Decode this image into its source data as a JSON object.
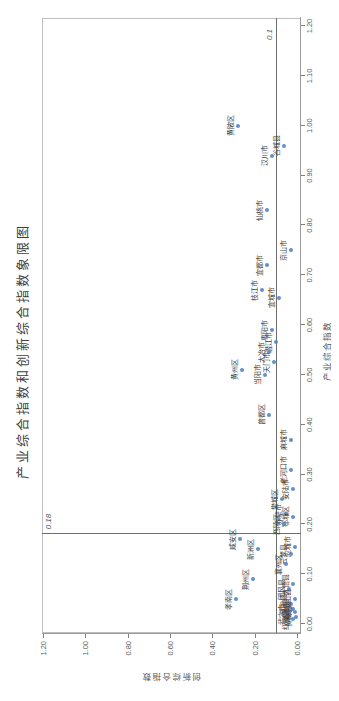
{
  "title": "产业综合指数和创新综合指数象限图",
  "chart_data": {
    "type": "scatter",
    "title": "产业综合指数和创新综合指数象限图",
    "xlabel": "产业综合指数",
    "ylabel": "创新综合指数",
    "xlim": [
      0.0,
      1.2
    ],
    "ylim": [
      0.0,
      1.2
    ],
    "x_ticks": [
      "0.00",
      "0.10",
      "0.20",
      "0.30",
      "0.40",
      "0.50",
      "0.60",
      "0.70",
      "0.80",
      "0.90",
      "1.00",
      "1.10",
      "1.20"
    ],
    "y_ticks": [
      "0.00",
      "0.20",
      "0.40",
      "0.60",
      "0.80",
      "1.00",
      "1.20"
    ],
    "grid": false,
    "legend": "none",
    "marker_color": "#5B8AC6",
    "reference_lines": {
      "vertical": {
        "value": 0.18,
        "label": "0.18"
      },
      "horizontal": {
        "value": 0.1,
        "label": "0.1"
      }
    },
    "points": [
      {
        "label": "黄陂区",
        "x": 1.0,
        "y": 0.28
      },
      {
        "label": "谷城县",
        "x": 0.96,
        "y": 0.06
      },
      {
        "label": "汉川市",
        "x": 0.94,
        "y": 0.12
      },
      {
        "label": "仙桃市",
        "x": 0.83,
        "y": 0.14
      },
      {
        "label": "京山市",
        "x": 0.75,
        "y": 0.03
      },
      {
        "label": "宜都市",
        "x": 0.72,
        "y": 0.14
      },
      {
        "label": "枝江市",
        "x": 0.67,
        "y": 0.165
      },
      {
        "label": "宜城市",
        "x": 0.655,
        "y": 0.085
      },
      {
        "label": "枣阳市",
        "x": 0.59,
        "y": 0.12
      },
      {
        "label": "潜江市",
        "x": 0.565,
        "y": 0.1
      },
      {
        "label": "大冶市",
        "x": 0.545,
        "y": 0.13
      },
      {
        "label": "天门市",
        "x": 0.525,
        "y": 0.11
      },
      {
        "label": "黄州区",
        "x": 0.51,
        "y": 0.26
      },
      {
        "label": "当阳市",
        "x": 0.5,
        "y": 0.15
      },
      {
        "label": "曾都区",
        "x": 0.42,
        "y": 0.13
      },
      {
        "label": "麻城市",
        "x": 0.37,
        "y": 0.03
      },
      {
        "label": "老河口市",
        "x": 0.31,
        "y": 0.03
      },
      {
        "label": "安陆市",
        "x": 0.27,
        "y": 0.02
      },
      {
        "label": "樊城区",
        "x": 0.25,
        "y": 0.07
      },
      {
        "label": "赤壁市",
        "x": 0.22,
        "y": 0.05
      },
      {
        "label": "鄂城区",
        "x": 0.215,
        "y": 0.02
      },
      {
        "label": "西陵区",
        "x": 0.2,
        "y": 0.06
      },
      {
        "label": "咸安区",
        "x": 0.17,
        "y": 0.27
      },
      {
        "label": "应城市",
        "x": 0.155,
        "y": 0.01
      },
      {
        "label": "新洲区",
        "x": 0.15,
        "y": 0.185
      },
      {
        "label": "云梦县",
        "x": 0.14,
        "y": 0.03
      },
      {
        "label": "襄州区",
        "x": 0.12,
        "y": 0.05
      },
      {
        "label": "荆州区",
        "x": 0.09,
        "y": 0.21
      },
      {
        "label": "大悟县",
        "x": 0.08,
        "y": 0.02
      },
      {
        "label": "团风县",
        "x": 0.07,
        "y": 0.04
      },
      {
        "label": "孝南区",
        "x": 0.05,
        "y": 0.29
      },
      {
        "label": "英山县",
        "x": 0.05,
        "y": 0.01
      },
      {
        "label": "罗田县",
        "x": 0.04,
        "y": 0.03
      },
      {
        "label": "浠水县",
        "x": 0.03,
        "y": 0.02
      },
      {
        "label": "蕲春县",
        "x": 0.025,
        "y": 0.01
      },
      {
        "label": "武穴市",
        "x": 0.02,
        "y": 0.04
      },
      {
        "label": "黄梅县",
        "x": 0.015,
        "y": 0.005
      },
      {
        "label": "红安县",
        "x": 0.01,
        "y": 0.02
      }
    ]
  }
}
